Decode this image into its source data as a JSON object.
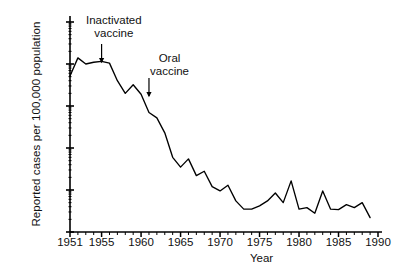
{
  "chart_data": {
    "type": "line",
    "title": "",
    "xlabel": "Year",
    "ylabel": "Reported cases per 100,000 population",
    "yscale": "log",
    "ylim": [
      0.001,
      100
    ],
    "xlim": [
      1951,
      1990
    ],
    "grid": false,
    "legend": null,
    "y_ticks": [
      "100",
      "10",
      "1",
      "0.1",
      "0.01",
      "0.001"
    ],
    "y_tick_values": [
      100,
      10,
      1,
      0.1,
      0.01,
      0.001
    ],
    "x_ticks": [
      "1951",
      "1955",
      "1960",
      "1965",
      "1970",
      "1975",
      "1980",
      "1985",
      "1990"
    ],
    "x_tick_values": [
      1951,
      1955,
      1960,
      1965,
      1970,
      1975,
      1980,
      1985,
      1990
    ],
    "x": [
      1951,
      1952,
      1953,
      1954,
      1955,
      1956,
      1957,
      1958,
      1959,
      1960,
      1961,
      1962,
      1963,
      1964,
      1965,
      1966,
      1967,
      1968,
      1969,
      1970,
      1971,
      1972,
      1973,
      1974,
      1975,
      1976,
      1977,
      1978,
      1979,
      1980,
      1981,
      1982,
      1983,
      1984,
      1985,
      1986,
      1987,
      1988,
      1989
    ],
    "values": [
      5.2,
      14.0,
      10.0,
      11.0,
      11.5,
      10.5,
      4.0,
      2.0,
      3.2,
      1.9,
      0.7,
      0.52,
      0.23,
      0.06,
      0.035,
      0.055,
      0.022,
      0.028,
      0.012,
      0.0095,
      0.013,
      0.0055,
      0.0035,
      0.0035,
      0.0042,
      0.0055,
      0.0085,
      0.005,
      0.0165,
      0.0035,
      0.0038,
      0.0028,
      0.0095,
      0.0035,
      0.0034,
      0.0045,
      0.0038,
      0.005,
      0.0022
    ],
    "annotations": [
      {
        "id": "inactivated",
        "label_line1": "Inactivated",
        "label_line2": "vaccine",
        "year": 1955
      },
      {
        "id": "oral",
        "label_line1": "Oral",
        "label_line2": "vaccine",
        "year": 1961
      }
    ],
    "line_color": "#000000",
    "axis_color": "#000000",
    "background": "#ffffff"
  }
}
